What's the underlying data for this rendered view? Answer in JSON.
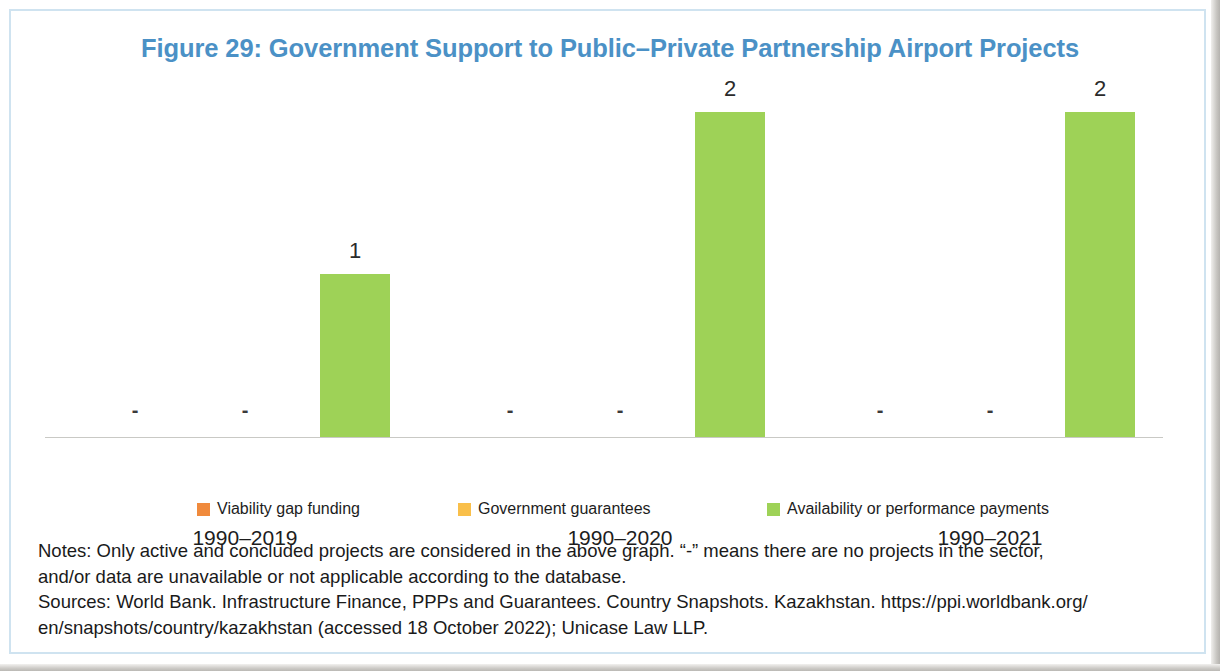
{
  "figure": {
    "title": "Figure 29: Government Support to Public–Private Partnership Airport Projects",
    "title_color": "#4b91c6",
    "frame_color": "#cfe3f0"
  },
  "chart_data": {
    "type": "bar",
    "title": "Figure 29: Government Support to Public–Private Partnership Airport Projects",
    "xlabel": "",
    "ylabel": "",
    "ylim": [
      0,
      2.2
    ],
    "grid": false,
    "legend_position": "bottom",
    "categories": [
      "1990–2019",
      "1990–2020",
      "1990–2021"
    ],
    "series": [
      {
        "name": "Viability gap funding",
        "color": "#f08a3c",
        "values": [
          null,
          null,
          null
        ],
        "display_values": [
          "-",
          "-",
          "-"
        ]
      },
      {
        "name": "Government guarantees",
        "color": "#f9bf4a",
        "values": [
          null,
          null,
          null
        ],
        "display_values": [
          "-",
          "-",
          "-"
        ]
      },
      {
        "name": "Availability or performance payments",
        "color": "#9ed257",
        "values": [
          1,
          2,
          2
        ],
        "display_values": [
          "1",
          "2",
          "2"
        ]
      }
    ],
    "no_data_marker": "-"
  },
  "legend": {
    "items": [
      {
        "label": "Viability gap funding",
        "color": "#f08a3c"
      },
      {
        "label": "Government guarantees",
        "color": "#f9bf4a"
      },
      {
        "label": "Availability or performance payments",
        "color": "#9ed257"
      }
    ]
  },
  "notes": {
    "line1": "Notes: Only active and concluded projects are considered in the above graph. “-” means there are no projects in the sector,",
    "line2": "and/or data are unavailable or not applicable according to the database.",
    "line3": "Sources: World Bank. Infrastructure Finance, PPPs and Guarantees. Country Snapshots. Kazakhstan. https://ppi.worldbank.org/",
    "line4": "en/snapshots/country/kazakhstan (accessed 18 October 2022); Unicase Law LLP."
  }
}
